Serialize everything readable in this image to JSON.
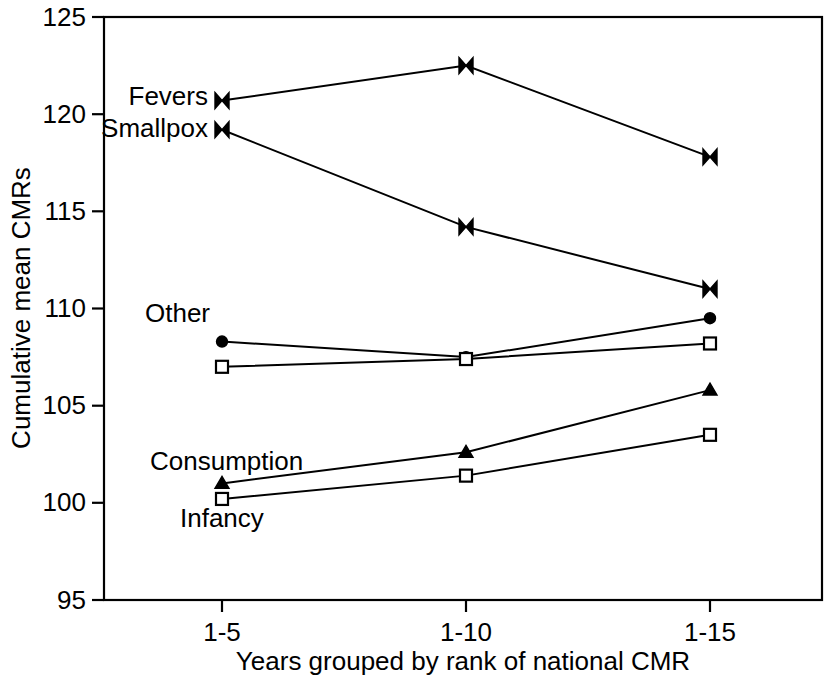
{
  "chart_data": {
    "type": "line",
    "title": "",
    "xlabel": "Years grouped by rank of national CMR",
    "ylabel": "Cumulative mean CMRs",
    "categories": [
      "1-5",
      "1-10",
      "1-15"
    ],
    "ylim": [
      95,
      125
    ],
    "yticks": [
      95,
      100,
      105,
      110,
      115,
      120,
      125
    ],
    "ytick_labels": [
      "95",
      "100",
      "105",
      "110",
      "115",
      "120",
      "125"
    ],
    "grid": false,
    "legend": "inline-labels",
    "series": [
      {
        "name": "Fevers",
        "label": "Fevers",
        "marker": "bowtie",
        "values": [
          120.7,
          122.5,
          117.8
        ]
      },
      {
        "name": "Smallpox",
        "label": "Smallpox",
        "marker": "bowtie",
        "values": [
          119.2,
          114.2,
          111.0
        ]
      },
      {
        "name": "Other",
        "label": "Other",
        "marker": "filled-circle",
        "values": [
          108.3,
          107.5,
          109.5
        ]
      },
      {
        "name": "Unlabelled upper square",
        "label": "",
        "marker": "open-square",
        "values": [
          107.0,
          107.4,
          108.2
        ]
      },
      {
        "name": "Consumption",
        "label": "Consumption",
        "marker": "triangle",
        "values": [
          101.0,
          102.6,
          105.8
        ]
      },
      {
        "name": "Infancy",
        "label": "Infancy",
        "marker": "open-square",
        "values": [
          100.2,
          101.4,
          103.5
        ]
      }
    ]
  },
  "axes": {
    "y_label": "Cumulative mean CMRs",
    "x_label": "Years grouped by rank of national CMR",
    "y_ticks": [
      "125",
      "120",
      "115",
      "110",
      "105",
      "100",
      "95"
    ],
    "x_ticks": [
      "1-5",
      "1-10",
      "1-15"
    ]
  },
  "annotations": {
    "fevers": "Fevers",
    "smallpox": "Smallpox",
    "other": "Other",
    "consumption": "Consumption",
    "infancy": "Infancy"
  },
  "colors": {
    "line": "#000000",
    "background": "#ffffff",
    "text": "#000000"
  }
}
